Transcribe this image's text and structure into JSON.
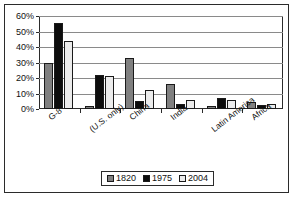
{
  "chart_data": {
    "type": "bar",
    "title": "",
    "xlabel": "",
    "ylabel": "",
    "ylim": [
      0,
      60
    ],
    "ytick_labels": [
      "60%",
      "50%",
      "40%",
      "30%",
      "20%",
      "10%",
      "0%"
    ],
    "ytick_values": [
      60,
      50,
      40,
      30,
      20,
      10,
      0
    ],
    "grid": true,
    "legend_position": "bottom",
    "categories": [
      "G-8",
      "(U.S. only)",
      "China",
      "India",
      "Latin America",
      "Africa"
    ],
    "series": [
      {
        "name": "1820",
        "color": "#808080",
        "values": [
          30,
          2,
          33,
          16,
          2,
          4.5
        ]
      },
      {
        "name": "1975",
        "color": "#0d0d0d",
        "values": [
          55.5,
          22,
          5,
          3,
          7,
          2.5
        ]
      },
      {
        "name": "2004",
        "color": "#ececec",
        "values": [
          44,
          21,
          12.5,
          6,
          5.5,
          3
        ]
      }
    ]
  },
  "legend": {
    "items": [
      {
        "label": "1820"
      },
      {
        "label": "1975"
      },
      {
        "label": "2004"
      }
    ]
  }
}
